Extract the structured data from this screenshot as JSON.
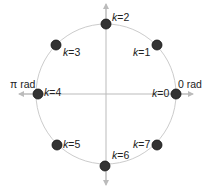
{
  "diagram": {
    "type": "unit-circle-phase-points",
    "center": [
      106,
      94
    ],
    "radius": 70,
    "circle_color": "#cccccc",
    "axis_color": "#bbbbbb",
    "point_color": "#333333",
    "axis_labels": {
      "right": "0 rad",
      "left": "π rad"
    },
    "points": [
      {
        "k": 0,
        "label_var": "k",
        "label_val": "=0",
        "x": 176,
        "y": 94,
        "lx": 152,
        "ly": 97
      },
      {
        "k": 1,
        "label_var": "k",
        "label_val": "=1",
        "x": 157,
        "y": 45,
        "lx": 133,
        "ly": 56
      },
      {
        "k": 2,
        "label_var": "k",
        "label_val": "=2",
        "x": 106,
        "y": 24,
        "lx": 112,
        "ly": 21
      },
      {
        "k": 3,
        "label_var": "k",
        "label_val": "=3",
        "x": 56,
        "y": 45,
        "lx": 63,
        "ly": 56
      },
      {
        "k": 4,
        "label_var": "k",
        "label_val": "=4",
        "x": 38,
        "y": 94,
        "lx": 44,
        "ly": 96
      },
      {
        "k": 5,
        "label_var": "k",
        "label_val": "=5",
        "x": 57,
        "y": 145,
        "lx": 63,
        "ly": 148
      },
      {
        "k": 6,
        "label_var": "k",
        "label_val": "=6",
        "x": 105,
        "y": 166,
        "lx": 112,
        "ly": 159
      },
      {
        "k": 7,
        "label_var": "k",
        "label_val": "=7",
        "x": 157,
        "y": 145,
        "lx": 133,
        "ly": 148
      }
    ]
  }
}
